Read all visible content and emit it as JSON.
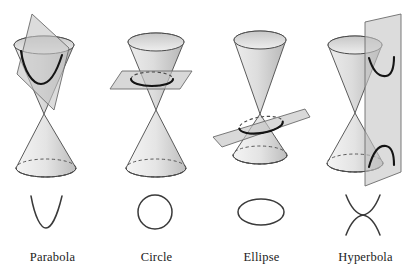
{
  "figure": {
    "background": "#ffffff",
    "width": 418,
    "height": 269
  },
  "style": {
    "cone_stroke": "#4a4a4a",
    "cone_fill_light": "#f2f2f2",
    "cone_fill_mid": "#d8d8d8",
    "cone_fill_dark": "#b9b9b9",
    "plane_fill": "#c9c9c9",
    "plane_stroke": "#6b6b6b",
    "curve_stroke": "#1b1b1b",
    "dashed_stroke": "#4a4a4a",
    "label_color": "#1b1b1b"
  },
  "panels": [
    {
      "id": "parabola",
      "label": "Parabola",
      "plane_orientation": "tilted-parallel-to-side",
      "curve_type": "parabola",
      "intersects": "one nappe"
    },
    {
      "id": "circle",
      "label": "Circle",
      "plane_orientation": "horizontal",
      "curve_type": "circle",
      "intersects": "upper nappe"
    },
    {
      "id": "ellipse",
      "label": "Ellipse",
      "plane_orientation": "oblique",
      "curve_type": "ellipse",
      "intersects": "lower nappe"
    },
    {
      "id": "hyperbola",
      "label": "Hyperbola",
      "plane_orientation": "vertical",
      "curve_type": "hyperbola",
      "intersects": "both nappes"
    }
  ]
}
